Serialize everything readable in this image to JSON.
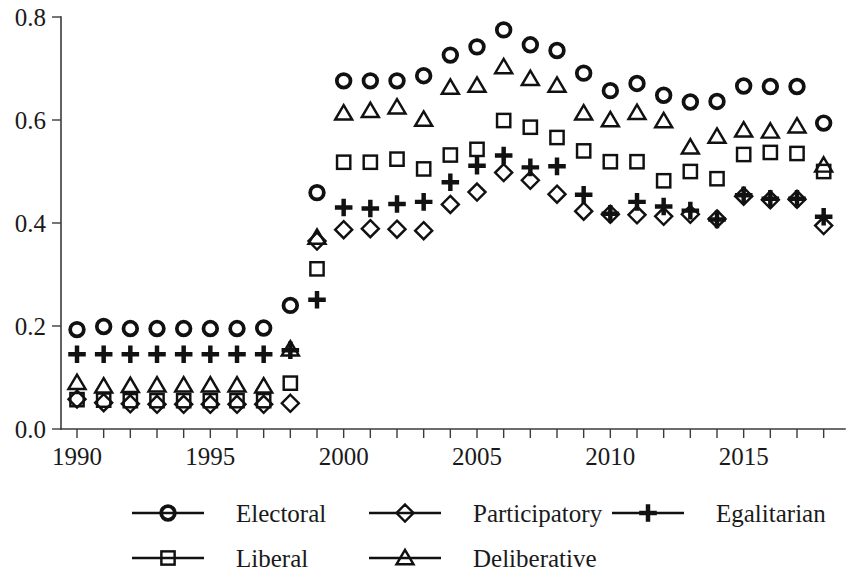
{
  "chart_data": {
    "type": "scatter",
    "title": "",
    "subtitle": "",
    "xlabel": "",
    "ylabel": "",
    "xlim": [
      1989.4,
      2018.8
    ],
    "ylim": [
      0.0,
      0.8
    ],
    "grid": false,
    "legend_position": "bottom",
    "ytick_labels": [
      "0.0",
      "0.2",
      "0.4",
      "0.6",
      "0.8"
    ],
    "ytick_values": [
      0.0,
      0.2,
      0.4,
      0.6,
      0.8
    ],
    "xtick_labels": [
      "1990",
      "1995",
      "2000",
      "2005",
      "2010",
      "2015"
    ],
    "xtick_values": [
      1990,
      1995,
      2000,
      2005,
      2010,
      2015
    ],
    "xtick_minor_values": [
      1991,
      1992,
      1993,
      1994,
      1996,
      1997,
      1998,
      1999,
      2001,
      2002,
      2003,
      2004,
      2006,
      2007,
      2008,
      2009,
      2011,
      2012,
      2013,
      2014,
      2016,
      2017,
      2018
    ],
    "x": [
      1990,
      1991,
      1992,
      1993,
      1994,
      1995,
      1996,
      1997,
      1998,
      1999,
      2000,
      2001,
      2002,
      2003,
      2004,
      2005,
      2006,
      2007,
      2008,
      2009,
      2010,
      2011,
      2012,
      2013,
      2014,
      2015,
      2016,
      2017,
      2018
    ],
    "series": [
      {
        "name": "Electoral",
        "marker": "circle",
        "values": [
          0.193,
          0.199,
          0.195,
          0.195,
          0.195,
          0.195,
          0.195,
          0.196,
          0.24,
          0.459,
          0.676,
          0.676,
          0.676,
          0.686,
          0.726,
          0.742,
          0.775,
          0.746,
          0.735,
          0.691,
          0.657,
          0.671,
          0.648,
          0.635,
          0.636,
          0.666,
          0.665,
          0.665,
          0.594
        ]
      },
      {
        "name": "Liberal",
        "marker": "square",
        "values": [
          0.057,
          0.056,
          0.055,
          0.055,
          0.055,
          0.055,
          0.055,
          0.055,
          0.089,
          0.311,
          0.518,
          0.518,
          0.524,
          0.505,
          0.532,
          0.543,
          0.599,
          0.586,
          0.566,
          0.54,
          0.519,
          0.519,
          0.482,
          0.5,
          0.486,
          0.533,
          0.537,
          0.535,
          0.5
        ]
      },
      {
        "name": "Participatory",
        "marker": "diamond",
        "values": [
          0.058,
          0.051,
          0.049,
          0.048,
          0.048,
          0.048,
          0.048,
          0.048,
          0.05,
          0.365,
          0.387,
          0.389,
          0.388,
          0.385,
          0.436,
          0.46,
          0.498,
          0.483,
          0.456,
          0.423,
          0.417,
          0.416,
          0.413,
          0.417,
          0.408,
          0.452,
          0.445,
          0.446,
          0.395
        ]
      },
      {
        "name": "Deliberative",
        "marker": "triangle",
        "values": [
          0.09,
          0.083,
          0.084,
          0.085,
          0.085,
          0.085,
          0.085,
          0.083,
          0.155,
          0.372,
          0.613,
          0.618,
          0.625,
          0.601,
          0.663,
          0.667,
          0.703,
          0.68,
          0.667,
          0.613,
          0.6,
          0.614,
          0.598,
          0.547,
          0.568,
          0.58,
          0.578,
          0.588,
          0.512
        ]
      },
      {
        "name": "Egalitarian",
        "marker": "plus",
        "values": [
          0.145,
          0.145,
          0.145,
          0.145,
          0.145,
          0.145,
          0.145,
          0.145,
          0.153,
          0.251,
          0.43,
          0.428,
          0.437,
          0.441,
          0.479,
          0.511,
          0.531,
          0.508,
          0.51,
          0.455,
          0.418,
          0.441,
          0.432,
          0.424,
          0.407,
          0.454,
          0.447,
          0.447,
          0.412
        ]
      }
    ]
  },
  "legend": {
    "entries": [
      {
        "label": "Electoral",
        "marker": "circle"
      },
      {
        "label": "Participatory",
        "marker": "diamond"
      },
      {
        "label": "Egalitarian",
        "marker": "plus"
      },
      {
        "label": "Liberal",
        "marker": "square"
      },
      {
        "label": "Deliberative",
        "marker": "triangle"
      }
    ]
  },
  "colors": {
    "marker": "#111111",
    "axis": "#3b3b3b",
    "text": "#1a1a1a",
    "background": "#ffffff"
  }
}
